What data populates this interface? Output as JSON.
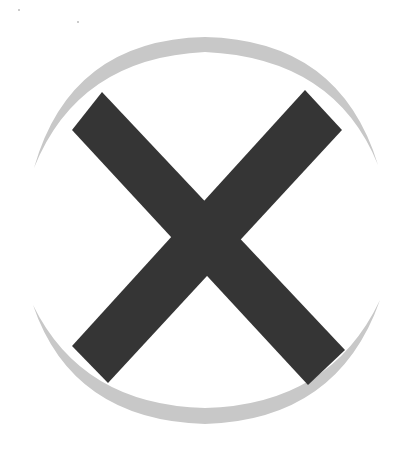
{
  "graphic": {
    "description": "Close / cancel icon: dark X cross inside a light gray crescent ring",
    "icon_name": "close-icon",
    "colors": {
      "background": "#ffffff",
      "cross": "#363636",
      "ring": "#c8c8c8"
    }
  }
}
